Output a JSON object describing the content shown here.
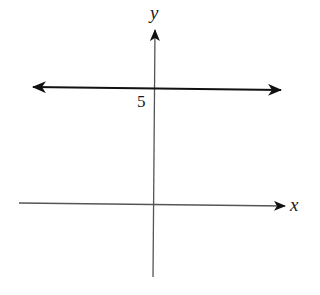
{
  "diagram": {
    "type": "coordinate-plane",
    "axes": {
      "x_label": "x",
      "y_label": "y"
    },
    "graph": {
      "description": "horizontal line y = 5",
      "equation": "y = 5",
      "y_intercept_label": "5"
    },
    "colors": {
      "axis": "#555555",
      "line": "#111111",
      "background": "#ffffff"
    }
  }
}
